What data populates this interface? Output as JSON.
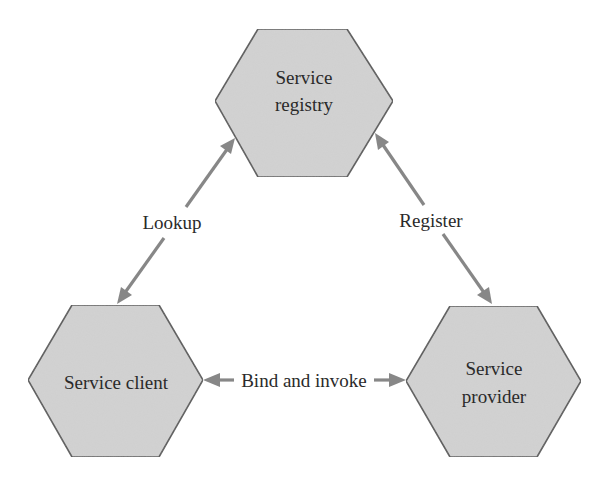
{
  "diagram": {
    "title": "",
    "colors": {
      "node_fill": "#d3d3d3",
      "node_stroke": "#555555",
      "edge": "#878787",
      "text": "#2a2a2a",
      "background": "#ffffff"
    },
    "nodes": [
      {
        "id": "service-registry",
        "shape": "hexagon",
        "label_lines": [
          "Service",
          "registry"
        ],
        "points": "258,29 347,29 393,101 347,177 258,177 215,101",
        "label_x": 304,
        "label_y": [
          84,
          111
        ]
      },
      {
        "id": "service-client",
        "shape": "hexagon",
        "label_lines": [
          "Service client"
        ],
        "points": "72,305 159,305 203,380 159,457 72,457 28,380",
        "label_x": 116,
        "label_y": [
          389
        ]
      },
      {
        "id": "service-provider",
        "shape": "hexagon",
        "label_lines": [
          "Service",
          "provider"
        ],
        "points": "450,306 537,306 581,381 537,457 450,457 406,381",
        "label_x": 494,
        "label_y": [
          375,
          403
        ]
      }
    ],
    "edges": [
      {
        "id": "lookup",
        "label": "Lookup",
        "from": "service-client",
        "to": "service-registry",
        "bidirectional": true,
        "x1": 117,
        "y1": 304,
        "x2": 235,
        "y2": 138,
        "label_x": 172,
        "label_y": 229
      },
      {
        "id": "register",
        "label": "Register",
        "from": "service-registry",
        "to": "service-provider",
        "bidirectional": true,
        "x1": 375,
        "y1": 133,
        "x2": 492,
        "y2": 304,
        "label_x": 431,
        "label_y": 227
      },
      {
        "id": "bind-and-invoke",
        "label": "Bind and invoke",
        "from": "service-client",
        "to": "service-provider",
        "bidirectional": true,
        "x1": 203,
        "y1": 380,
        "x2": 406,
        "y2": 380,
        "label_x": 304,
        "label_y": 387
      }
    ]
  }
}
